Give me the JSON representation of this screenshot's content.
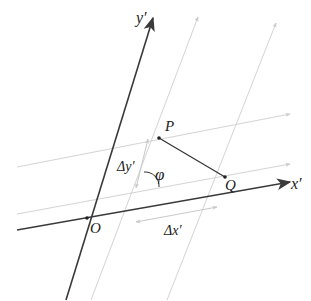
{
  "diagram": {
    "type": "oblique-coordinate-system",
    "colors": {
      "axis": "#3a3a3a",
      "grid": "#d4d4d4",
      "segment": "#333333",
      "dimension": "#c8c8c8",
      "text": "#222222"
    },
    "axes": {
      "x_label": "x′",
      "y_label": "y′",
      "origin_label": "O"
    },
    "points": [
      {
        "label": "P",
        "x": 159,
        "y": 138
      },
      {
        "label": "Q",
        "x": 225,
        "y": 177
      }
    ],
    "annotations": {
      "angle": "φ",
      "delta_x": "Δx′",
      "delta_y": "Δy′"
    }
  }
}
